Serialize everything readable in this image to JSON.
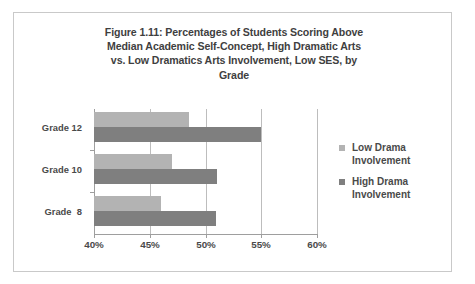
{
  "figure": {
    "title_lines": [
      "Figure 1.11:  Percentages of Students Scoring Above",
      "Median Academic Self-Concept, High Dramatic Arts",
      "vs. Low Dramatics Arts Involvement, Low SES, by",
      "Grade"
    ],
    "title_full": "Figure 1.11:  Percentages of Students Scoring Above Median Academic Self-Concept, High Dramatic Arts vs. Low Dramatics Arts Involvement, Low SES, by Grade"
  },
  "legend": {
    "position": "right",
    "entries": [
      {
        "label_line1": "Low Drama",
        "label_line2": "Involvement",
        "color": "#b3b3b3"
      },
      {
        "label_line1": "High Drama",
        "label_line2": "Involvement",
        "color": "#7f7f7f"
      }
    ]
  },
  "axis": {
    "tick_labels": [
      "40%",
      "45%",
      "50%",
      "55%",
      "60%"
    ],
    "category_labels": [
      "Grade 12",
      "Grade 10",
      "Grade  8"
    ]
  },
  "chart_data": {
    "type": "bar",
    "orientation": "horizontal",
    "title": "Figure 1.11:  Percentages of Students Scoring Above Median Academic Self-Concept, High Dramatic Arts vs. Low Dramatics Arts Involvement, Low SES, by Grade",
    "xlabel": "",
    "ylabel": "",
    "categories": [
      "Grade 12",
      "Grade 10",
      "Grade  8"
    ],
    "series": [
      {
        "name": "Low Drama Involvement",
        "color": "#b3b3b3",
        "values": [
          48.5,
          47.0,
          46.0
        ]
      },
      {
        "name": "High Drama Involvement",
        "color": "#7f7f7f",
        "values": [
          55.0,
          51.0,
          50.9
        ]
      }
    ],
    "xlim": [
      40,
      60
    ],
    "xticks": [
      40,
      45,
      50,
      55,
      60
    ],
    "xtick_labels": [
      "40%",
      "45%",
      "50%",
      "55%",
      "60%"
    ],
    "grid": "vertical",
    "legend_position": "right",
    "value_unit": "percent"
  }
}
